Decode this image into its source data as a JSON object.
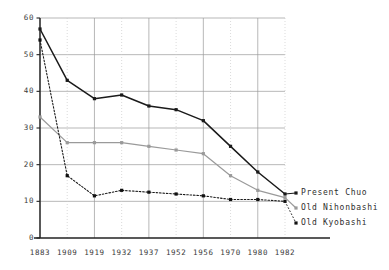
{
  "chart_data": {
    "type": "line",
    "title": "",
    "subtitle": "",
    "xlabel": "",
    "ylabel": "",
    "categories": [
      "1883",
      "1909",
      "1919",
      "1932",
      "1937",
      "1952",
      "1956",
      "1970",
      "1980",
      "1982"
    ],
    "xlim": [
      0,
      9
    ],
    "ylim": [
      0,
      60
    ],
    "yticks": [
      "0",
      "10",
      "20",
      "30",
      "40",
      "50",
      "60"
    ],
    "ytick_values": [
      0,
      10,
      20,
      30,
      40,
      50,
      60
    ],
    "grid": true,
    "grid_axes": "both",
    "legend_position": "right-inline-at-line-end",
    "series": [
      {
        "name": "Present Chuo",
        "style": "solid",
        "color": "#1a1a1a",
        "marker": "square",
        "values": [
          57,
          43,
          38,
          39,
          36,
          35,
          32,
          25,
          18,
          12
        ]
      },
      {
        "name": "Old Nihonbashi",
        "style": "solid",
        "color": "#9a9a9a",
        "marker": "square",
        "values": [
          33,
          26,
          26,
          26,
          25,
          24,
          23,
          17,
          13,
          11
        ]
      },
      {
        "name": "Old Kyobashi",
        "style": "dashed",
        "color": "#1a1a1a",
        "marker": "square",
        "values": [
          54,
          17,
          11.5,
          13,
          12.5,
          12,
          11.5,
          10.5,
          10.5,
          10
        ]
      }
    ]
  },
  "legend": {
    "items": [
      {
        "label": "Present Chuo"
      },
      {
        "label": "Old Nihonbashi"
      },
      {
        "label": "Old Kyobashi"
      }
    ]
  },
  "axis": {
    "y_tick_labels": [
      "60",
      "50",
      "40",
      "30",
      "20",
      "10",
      "0"
    ],
    "x_tick_labels": [
      "1883",
      "1909",
      "1919",
      "1932",
      "1937",
      "1952",
      "1956",
      "1970",
      "1980",
      "1982"
    ]
  },
  "colors": {
    "series_present_chuo": "#1a1a1a",
    "series_old_nihonbashi": "#9a9a9a",
    "series_old_kyobashi": "#1a1a1a",
    "grid_major": "#999999",
    "grid_minor": "#cccccc",
    "axis": "#222222",
    "background": "#ffffff"
  }
}
